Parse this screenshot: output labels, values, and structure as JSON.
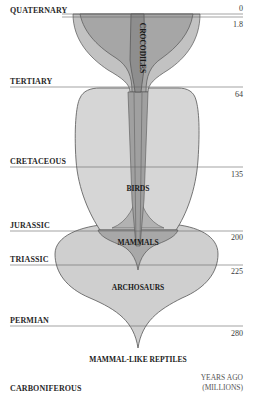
{
  "diagram": {
    "title": "",
    "periods": [
      {
        "name": "QUATERNARY",
        "age_top": "0",
        "age_bottom": "1.8"
      },
      {
        "name": "TERTIARY",
        "age": "64"
      },
      {
        "name": "CRETACEOUS",
        "age": "135"
      },
      {
        "name": "JURASSIC",
        "age": "200"
      },
      {
        "name": "TRIASSIC",
        "age": "225"
      },
      {
        "name": "PERMIAN",
        "age": "280"
      },
      {
        "name": "CARBONIFEROUS",
        "age": ""
      }
    ],
    "clades": {
      "crocodiles": "CROCODILES",
      "birds": "BIRDS",
      "mammals": "MAMMALS",
      "archosaurs": "ARCHOSAURS",
      "mammal_like_reptiles": "MAMMAL-LIKE REPTILES"
    },
    "axis": {
      "line1": "YEARS AGO",
      "line2": "(MILLIONS)"
    },
    "colors": {
      "light_fill": "#d4d4d4",
      "mid_fill": "#bdbdbd",
      "dark_fill": "#a4a4a4",
      "outline": "#555555",
      "rule": "#666666"
    }
  }
}
